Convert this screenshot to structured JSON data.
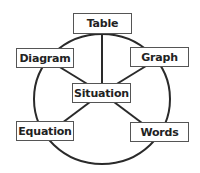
{
  "diagram": {
    "type": "hub-and-ring",
    "center_node": {
      "id": "situation",
      "label": "Situation"
    },
    "outer_nodes": [
      {
        "id": "table",
        "label": "Table"
      },
      {
        "id": "graph",
        "label": "Graph"
      },
      {
        "id": "words",
        "label": "Words"
      },
      {
        "id": "equation",
        "label": "Equation"
      },
      {
        "id": "diagram",
        "label": "Diagram"
      }
    ],
    "edges": [
      {
        "from": "situation",
        "to": "table"
      },
      {
        "from": "situation",
        "to": "graph"
      },
      {
        "from": "situation",
        "to": "words"
      },
      {
        "from": "situation",
        "to": "equation"
      },
      {
        "from": "situation",
        "to": "diagram"
      }
    ],
    "ring": "circle connecting all outer nodes",
    "colors": {
      "line": "#2a2a2a",
      "box_border": "#555555",
      "text": "#222222",
      "background": "#ffffff"
    }
  }
}
